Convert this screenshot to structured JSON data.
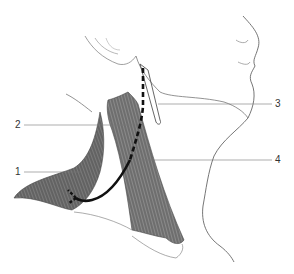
{
  "figure": {
    "type": "anatomical illustration",
    "labels": [
      {
        "id": "1",
        "text": "1"
      },
      {
        "id": "2",
        "text": "2"
      },
      {
        "id": "3",
        "text": "3"
      },
      {
        "id": "4",
        "text": "4"
      }
    ],
    "colors": {
      "outline": "#555555",
      "muscle_fill": "#6e6e6e",
      "path_line": "#111111",
      "leader_line": "#777777"
    }
  }
}
